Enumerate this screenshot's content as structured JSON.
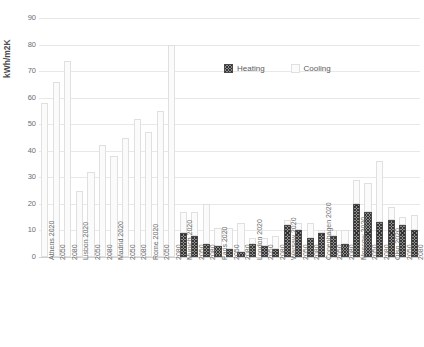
{
  "chart_data": {
    "type": "bar",
    "subtype": "stacked",
    "title": "",
    "xlabel": "",
    "ylabel": "kWh/m2K",
    "ylim": [
      0,
      90
    ],
    "yticks": [
      0,
      10,
      20,
      30,
      40,
      50,
      60,
      70,
      80,
      90
    ],
    "grid": true,
    "legend_position": "inside-top-center",
    "categories": [
      "Athens 2020",
      "Athens 2050",
      "Athens 2080",
      "Lisbon 2020",
      "Lisbon 2050",
      "Lisbon 2080",
      "Madrid 2020",
      "Madrid 2050",
      "Madrid 2080",
      "Rome 2020",
      "Rome 2050",
      "Rome 2080",
      "Munich 2020",
      "Munich 2050",
      "Munich 2080",
      "Paris 2020",
      "Paris 2050",
      "Paris 2080",
      "London 2020",
      "London 2050",
      "London 2080",
      "Warsaw 2020",
      "Warsaw 2050",
      "Warsaw 2080",
      "Copenhagen 2020",
      "Copenhagen 2050",
      "Copenhagen 2080",
      "Moscow 2020",
      "Moscow 2050",
      "Moscow 2080",
      "Olso 2020",
      "Olso 2050",
      "Olso 2080"
    ],
    "cities": [
      "Athens",
      "Lisbon",
      "Madrid",
      "Rome",
      "Munich",
      "Paris",
      "London",
      "Warsaw",
      "Copenhagen",
      "Moscow",
      "Olso"
    ],
    "years": [
      "2020",
      "2050",
      "2080"
    ],
    "series": [
      {
        "name": "Heating",
        "color": "#8e8e8e",
        "pattern": "crosshatch",
        "values": [
          0,
          0,
          0,
          0,
          0,
          0,
          0,
          0,
          0,
          0,
          0,
          0,
          9,
          8,
          5,
          4,
          3,
          2,
          5,
          4,
          3,
          12,
          10,
          7,
          9,
          8,
          5,
          20,
          17,
          13,
          14,
          12,
          10
        ]
      },
      {
        "name": "Cooling",
        "color": "#fbfbfb",
        "pattern": "dotted",
        "values": [
          58,
          66,
          74,
          25,
          32,
          42,
          38,
          45,
          52,
          47,
          55,
          80,
          8,
          9,
          15,
          7,
          8,
          11,
          2,
          3,
          5,
          2,
          3,
          6,
          1,
          2,
          5,
          9,
          11,
          23,
          5,
          3,
          6
        ]
      }
    ]
  },
  "legend": {
    "items": [
      {
        "label": "Heating",
        "swatch": "heating"
      },
      {
        "label": "Cooling",
        "swatch": "cooling"
      }
    ]
  },
  "axis": {
    "y_title": "kWh/m2K"
  }
}
